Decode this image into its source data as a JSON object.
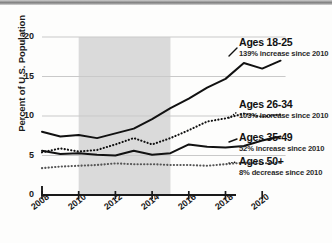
{
  "chart_data": {
    "type": "line",
    "title": "",
    "xlabel": "",
    "ylabel": "Percent of U.S. Population",
    "xlim": [
      2008,
      2021
    ],
    "ylim": [
      0,
      20
    ],
    "grid": true,
    "legend_position": "right",
    "x_ticks": [
      "2008",
      "2010",
      "2012",
      "2014",
      "2016",
      "2018",
      "2020"
    ],
    "x_tick_values": [
      2008,
      2010,
      2012,
      2014,
      2016,
      2018,
      2020
    ],
    "y_ticks": [
      "0",
      "5",
      "10",
      "15",
      "20"
    ],
    "y_tick_values": [
      0,
      5,
      10,
      15,
      20
    ],
    "shaded_band": {
      "from": 2010,
      "to": 2015,
      "color": "#d4d4d4"
    },
    "x": [
      2008,
      2009,
      2010,
      2011,
      2012,
      2013,
      2014,
      2015,
      2016,
      2017,
      2018,
      2019,
      2020,
      2021
    ],
    "series": [
      {
        "name": "Ages 18-25",
        "style": "solid",
        "color": "#111111",
        "values": [
          8.0,
          7.4,
          7.6,
          7.2,
          7.8,
          8.4,
          9.6,
          11.0,
          12.2,
          13.6,
          14.7,
          16.7,
          16.0,
          17.0
        ]
      },
      {
        "name": "Ages 26-34",
        "style": "dotted",
        "color": "#111111",
        "values": [
          5.4,
          5.9,
          5.5,
          5.7,
          6.4,
          7.2,
          6.4,
          7.2,
          8.2,
          9.3,
          9.7,
          10.3,
          9.9,
          10.2
        ]
      },
      {
        "name": "Ages 35-49",
        "style": "solid",
        "color": "#111111",
        "values": [
          5.6,
          5.2,
          5.3,
          5.1,
          5.0,
          5.6,
          5.1,
          5.3,
          6.4,
          6.1,
          6.0,
          6.2,
          6.9,
          7.4
        ]
      },
      {
        "name": "Ages 50+",
        "style": "dotted",
        "color": "#555555",
        "values": [
          3.4,
          3.6,
          3.7,
          3.8,
          4.0,
          3.9,
          3.9,
          3.8,
          3.8,
          3.7,
          3.9,
          4.1,
          4.0,
          4.1
        ]
      }
    ]
  },
  "legend": [
    {
      "title": "Ages 18-25",
      "subtitle": "139% increase since 2010"
    },
    {
      "title": "Ages 26-34",
      "subtitle": "103% increase since 2010"
    },
    {
      "title": "Ages 35-49",
      "subtitle": "52% increase since 2010"
    },
    {
      "title": "Ages 50+",
      "subtitle": "8% decrease since 2010"
    }
  ]
}
